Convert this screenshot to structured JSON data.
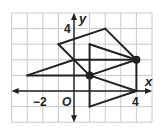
{
  "figure": {
    "type": "coordinate-plane",
    "grid": {
      "x_min": -4,
      "x_max": 5,
      "y_min": -2,
      "y_max": 5,
      "unit_px": 15.6,
      "origin_px": [
        74,
        91
      ]
    },
    "colors": {
      "grid": "#c8c8c8",
      "line": "#222222",
      "background": "#ffffff"
    },
    "axes": {
      "x_label": "x",
      "y_label": "y",
      "origin_label": "O",
      "tick_labels": [
        {
          "axis": "x",
          "value": -2,
          "text": "−2"
        },
        {
          "axis": "x",
          "value": 4,
          "text": "4"
        },
        {
          "axis": "y",
          "value": 4,
          "text": "4"
        }
      ]
    },
    "segments": [
      {
        "from": [
          -1,
          3
        ],
        "to": [
          2,
          4
        ]
      },
      {
        "from": [
          2,
          4
        ],
        "to": [
          4,
          2
        ]
      },
      {
        "from": [
          -1,
          3
        ],
        "to": [
          1,
          1
        ]
      },
      {
        "from": [
          -3,
          1
        ],
        "to": [
          0,
          2
        ]
      },
      {
        "from": [
          -3,
          1
        ],
        "to": [
          1,
          1
        ]
      },
      {
        "from": [
          0,
          2
        ],
        "to": [
          4,
          2
        ]
      },
      {
        "from": [
          1,
          3
        ],
        "to": [
          4,
          2
        ]
      },
      {
        "from": [
          1,
          1
        ],
        "to": [
          4,
          2
        ]
      },
      {
        "from": [
          1,
          3
        ],
        "to": [
          1,
          -1
        ]
      },
      {
        "from": [
          1,
          1
        ],
        "to": [
          4,
          0
        ]
      },
      {
        "from": [
          4,
          0
        ],
        "to": [
          1,
          -1
        ]
      },
      {
        "from": [
          4,
          2
        ],
        "to": [
          4,
          0
        ]
      }
    ],
    "points": [
      {
        "name": "center-of-dilation-1",
        "at": [
          1,
          1
        ]
      },
      {
        "name": "center-of-dilation-2",
        "at": [
          4,
          2
        ]
      }
    ]
  }
}
